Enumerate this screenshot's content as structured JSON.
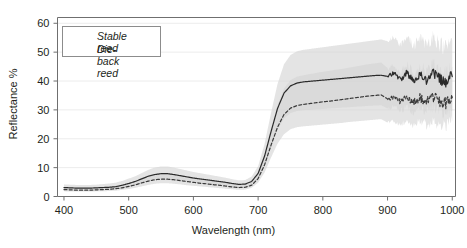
{
  "chart_data": {
    "type": "line",
    "title": "",
    "xlabel": "Wavelength (nm)",
    "ylabel": "Reflectance %",
    "xlim": [
      390,
      1005
    ],
    "ylim": [
      0,
      62
    ],
    "xticks": [
      400,
      500,
      600,
      700,
      800,
      900,
      1000
    ],
    "yticks": [
      0,
      10,
      20,
      30,
      40,
      50,
      60
    ],
    "grid": "horizontal-faint",
    "legend_position": "top-left",
    "legend": [
      {
        "name": "Stable reed",
        "style": "solid",
        "color": "#2b2b2b"
      },
      {
        "name": "Die-back reed",
        "style": "dashed",
        "color": "#3a3a3a"
      }
    ],
    "band_color": "#d4d4d4",
    "x": [
      400,
      410,
      420,
      430,
      440,
      450,
      460,
      470,
      480,
      490,
      500,
      510,
      520,
      530,
      540,
      550,
      560,
      570,
      580,
      590,
      600,
      610,
      620,
      630,
      640,
      650,
      660,
      670,
      680,
      690,
      700,
      710,
      720,
      730,
      740,
      750,
      760,
      770,
      780,
      790,
      800,
      810,
      820,
      830,
      840,
      850,
      860,
      870,
      880,
      890,
      900,
      910,
      920,
      930,
      940,
      950,
      960,
      970,
      980,
      990,
      1000
    ],
    "series": [
      {
        "name": "Stable reed",
        "style": "solid",
        "values": [
          3.1,
          3.0,
          2.9,
          2.9,
          2.9,
          3.0,
          3.1,
          3.2,
          3.4,
          3.9,
          4.5,
          5.2,
          6.1,
          7.0,
          7.6,
          7.9,
          7.9,
          7.6,
          7.2,
          6.8,
          6.4,
          6.1,
          5.8,
          5.5,
          5.2,
          4.9,
          4.5,
          4.2,
          4.3,
          5.2,
          8.0,
          14.0,
          22.5,
          30.5,
          35.8,
          38.3,
          39.3,
          39.7,
          39.9,
          40.1,
          40.3,
          40.5,
          40.7,
          40.9,
          41.1,
          41.3,
          41.5,
          41.7,
          41.9,
          42.0,
          41.6,
          42.8,
          40.4,
          43.1,
          39.7,
          42.5,
          40.2,
          43.0,
          40.8,
          39.6,
          41.5
        ],
        "band_lower": [
          2.2,
          2.1,
          2.0,
          2.0,
          2.0,
          2.1,
          2.2,
          2.3,
          2.4,
          2.8,
          3.2,
          3.8,
          4.5,
          5.2,
          5.7,
          6.0,
          6.0,
          5.8,
          5.5,
          5.2,
          4.9,
          4.6,
          4.4,
          4.1,
          3.9,
          3.6,
          3.3,
          3.1,
          3.2,
          3.9,
          6.0,
          10.5,
          17.0,
          23.0,
          27.0,
          28.9,
          29.6,
          29.9,
          30.0,
          30.2,
          30.3,
          30.5,
          30.6,
          30.8,
          30.9,
          31.1,
          31.2,
          31.4,
          31.5,
          31.6,
          30.5,
          31.0,
          29.5,
          31.2,
          29.0,
          30.8,
          29.4,
          31.0,
          29.6,
          28.8,
          30.0
        ],
        "band_upper": [
          4.2,
          4.1,
          4.0,
          4.0,
          4.0,
          4.1,
          4.3,
          4.5,
          4.8,
          5.4,
          6.2,
          7.0,
          8.1,
          9.2,
          10.0,
          10.4,
          10.4,
          10.0,
          9.5,
          9.0,
          8.5,
          8.1,
          7.7,
          7.3,
          6.9,
          6.5,
          6.0,
          5.6,
          5.7,
          6.9,
          10.5,
          18.2,
          29.0,
          39.0,
          45.8,
          49.0,
          50.3,
          50.8,
          51.1,
          51.4,
          51.7,
          52.0,
          52.3,
          52.6,
          52.9,
          53.2,
          53.5,
          53.8,
          54.1,
          54.4,
          53.8,
          55.5,
          52.5,
          56.0,
          51.8,
          55.2,
          52.4,
          55.8,
          53.0,
          51.6,
          54.0
        ]
      },
      {
        "name": "Die-back reed",
        "style": "dashed",
        "values": [
          2.4,
          2.3,
          2.2,
          2.2,
          2.2,
          2.3,
          2.4,
          2.5,
          2.7,
          3.0,
          3.5,
          4.0,
          4.7,
          5.3,
          5.8,
          6.0,
          6.0,
          5.8,
          5.5,
          5.2,
          4.9,
          4.6,
          4.4,
          4.1,
          3.9,
          3.6,
          3.3,
          3.1,
          3.2,
          3.9,
          6.2,
          11.0,
          17.8,
          24.0,
          28.4,
          30.6,
          31.5,
          31.9,
          32.2,
          32.5,
          32.8,
          33.0,
          33.3,
          33.6,
          33.9,
          34.2,
          34.5,
          34.8,
          35.0,
          35.2,
          33.8,
          34.4,
          32.9,
          34.6,
          32.4,
          34.2,
          32.8,
          34.5,
          33.1,
          32.2,
          34.2
        ],
        "band_lower": [
          1.8,
          1.7,
          1.7,
          1.7,
          1.7,
          1.8,
          1.8,
          1.9,
          2.0,
          2.3,
          2.6,
          3.0,
          3.5,
          4.0,
          4.4,
          4.6,
          4.6,
          4.4,
          4.2,
          3.9,
          3.7,
          3.5,
          3.3,
          3.1,
          2.9,
          2.7,
          2.5,
          2.3,
          2.4,
          3.0,
          4.8,
          8.3,
          13.5,
          18.3,
          21.6,
          23.3,
          24.0,
          24.3,
          24.5,
          24.7,
          24.9,
          25.1,
          25.3,
          25.5,
          25.8,
          26.0,
          26.2,
          26.4,
          26.6,
          26.8,
          25.6,
          26.1,
          24.9,
          26.2,
          24.5,
          25.9,
          24.8,
          26.1,
          25.0,
          24.3,
          25.9
        ],
        "band_upper": [
          3.1,
          3.0,
          2.9,
          2.9,
          2.9,
          3.0,
          3.2,
          3.3,
          3.6,
          4.0,
          4.6,
          5.3,
          6.2,
          7.0,
          7.6,
          7.9,
          7.9,
          7.6,
          7.2,
          6.8,
          6.4,
          6.1,
          5.8,
          5.5,
          5.2,
          4.9,
          4.5,
          4.2,
          4.3,
          5.2,
          8.2,
          14.5,
          23.4,
          31.6,
          37.4,
          40.3,
          41.5,
          42.0,
          42.4,
          42.8,
          43.2,
          43.5,
          43.9,
          44.2,
          44.6,
          45.0,
          45.4,
          45.8,
          46.1,
          46.4,
          44.5,
          45.3,
          43.3,
          45.6,
          42.7,
          45.0,
          43.2,
          45.4,
          43.6,
          42.4,
          45.0
        ]
      }
    ],
    "noise_onset_nm": 900,
    "noise_note": "High-frequency sensor noise beyond ~900 nm"
  },
  "axis": {
    "xlabel": "Wavelength (nm)",
    "ylabel": "Reflectance %",
    "xticklabels": [
      "400",
      "500",
      "600",
      "700",
      "800",
      "900",
      "1000"
    ],
    "yticklabels": [
      "0",
      "10",
      "20",
      "30",
      "40",
      "50",
      "60"
    ]
  },
  "legend": {
    "items": [
      {
        "label": "Stable reed"
      },
      {
        "label": "Die-back reed"
      }
    ]
  }
}
